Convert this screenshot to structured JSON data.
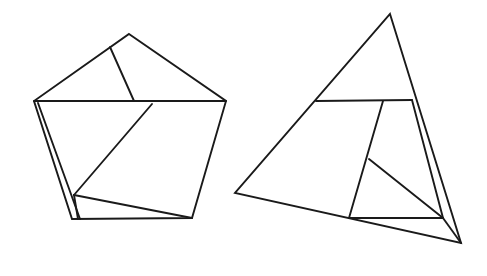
{
  "figure": {
    "background_color": "#ffffff",
    "stroke_color": "#1a1a1a",
    "stroke_width": 1.9,
    "canvas": {
      "width": 487,
      "height": 276
    },
    "shapes": [
      {
        "id": "pentagon",
        "name": "left-pentagon",
        "type": "polygon",
        "label": "Pentagon",
        "outline_points": "129,34 226,101 192,218 72,219 34,101",
        "vertices": [
          {
            "name": "apex",
            "x": 129,
            "y": 34
          },
          {
            "name": "right",
            "x": 226,
            "y": 101
          },
          {
            "name": "bottom-right",
            "x": 192,
            "y": 218
          },
          {
            "name": "bottom-left",
            "x": 72,
            "y": 219
          },
          {
            "name": "left",
            "x": 34,
            "y": 101
          }
        ],
        "internal_lines": [
          {
            "name": "upper-chord",
            "x1": 34,
            "y1": 101,
            "x2": 226,
            "y2": 101
          },
          {
            "name": "apex-spoke",
            "x1": 110,
            "y1": 47,
            "x2": 134,
            "y2": 101
          },
          {
            "name": "inner-left-edge",
            "x1": 38,
            "y1": 103,
            "x2": 80,
            "y2": 219
          },
          {
            "name": "long-diagonal",
            "x1": 152,
            "y1": 104,
            "x2": 74,
            "y2": 195
          },
          {
            "name": "lower-chord",
            "x1": 74,
            "y1": 195,
            "x2": 192,
            "y2": 218
          },
          {
            "name": "hub-to-base",
            "x1": 74,
            "y1": 195,
            "x2": 78,
            "y2": 219
          }
        ]
      },
      {
        "id": "triangle",
        "name": "right-triangle",
        "type": "polygon",
        "label": "Triangle",
        "outline_points": "390,14 461,243 235,193",
        "vertices": [
          {
            "name": "apex",
            "x": 390,
            "y": 14
          },
          {
            "name": "bottom-right-tip",
            "x": 461,
            "y": 243
          },
          {
            "name": "bottom-left",
            "x": 235,
            "y": 193
          }
        ],
        "internal_lines": [
          {
            "name": "upper-crossbar",
            "x1": 316,
            "y1": 101,
            "x2": 412,
            "y2": 100
          },
          {
            "name": "center-vertical",
            "x1": 383,
            "y1": 101,
            "x2": 349,
            "y2": 218
          },
          {
            "name": "right-inner-edge",
            "x1": 412,
            "y1": 100,
            "x2": 443,
            "y2": 218
          },
          {
            "name": "lower-crossbar",
            "x1": 349,
            "y1": 218,
            "x2": 443,
            "y2": 218
          },
          {
            "name": "inner-diagonal",
            "x1": 369,
            "y1": 159,
            "x2": 443,
            "y2": 218
          },
          {
            "name": "corner-spoke",
            "x1": 443,
            "y1": 218,
            "x2": 461,
            "y2": 243
          }
        ]
      }
    ]
  }
}
